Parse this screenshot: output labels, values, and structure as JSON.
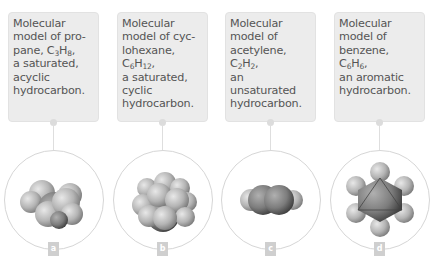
{
  "panels": [
    {
      "label": "a",
      "caption": {
        "pre": "Molecular model of pro-pane, C",
        "s1": "3",
        "mid": "H",
        "s2": "8",
        "post": ", a saturated, acyclic hydrocarbon."
      },
      "molecule": "propane",
      "caption_lines": [
        "Molecular",
        "model of pro-",
        "pane, C3H8,",
        "a saturated,",
        "acyclic",
        "hydrocarbon."
      ]
    },
    {
      "label": "b",
      "molecule": "cyclohexane",
      "caption_lines": [
        "Molecular",
        "model of cyc-",
        "lohexane,",
        "C6H12,",
        "a saturated,",
        "cyclic",
        "hydrocarbon."
      ]
    },
    {
      "label": "c",
      "molecule": "acetylene",
      "caption_lines": [
        "Molecular",
        "model of",
        "acetylene,",
        "C2H2,",
        "an unsaturated",
        "hydrocarbon."
      ]
    },
    {
      "label": "d",
      "molecule": "benzene",
      "caption_lines": [
        "Molecular",
        "model of",
        "benzene, C6H6,",
        "an aromatic",
        "hydrocarbon."
      ]
    }
  ],
  "colors": {
    "card_bg": "#ececec",
    "text": "#555555",
    "circle_border": "#d6d6d6",
    "label_bg": "#cfcfcf"
  }
}
